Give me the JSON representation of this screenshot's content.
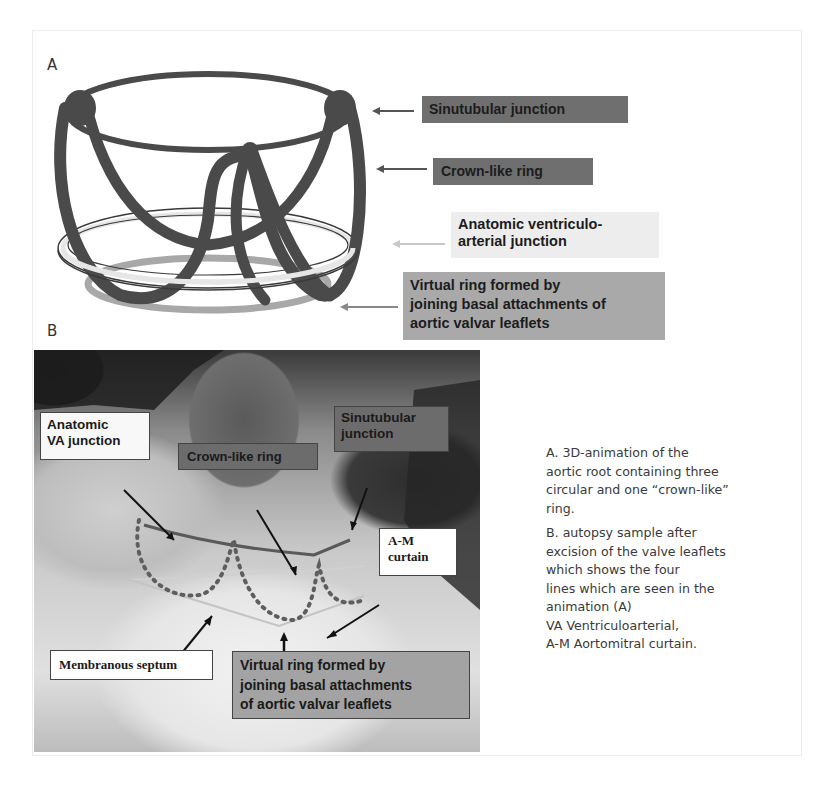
{
  "panel_a": {
    "letter": "A",
    "labels": {
      "sinutubular": "Sinutubular junction",
      "crown": "Crown-like ring",
      "anatomic_line1": "Anatomic ventriculo-",
      "anatomic_line2": "arterial junction",
      "virtual_line1": "Virtual ring formed by",
      "virtual_line2": "joining basal attachments of",
      "virtual_line3": "aortic valvar leaflets"
    },
    "colors": {
      "dark_label": "#6f6f6f",
      "mid_label": "#a9a9a9",
      "light_label": "#ededed",
      "ring_stroke": "#4a4a4a"
    }
  },
  "panel_b": {
    "letter": "B",
    "labels": {
      "anatomic_line1": "Anatomic",
      "anatomic_line2": "VA junction",
      "crown": "Crown-like ring",
      "sinutubular_line1": "Sinutubular",
      "sinutubular_line2": "junction",
      "am_line1": "A-M",
      "am_line2": "curtain",
      "membranous": "Membranous septum",
      "virtual_line1": "Virtual ring formed by",
      "virtual_line2": "joining basal attachments",
      "virtual_line3": "of aortic valvar leaflets"
    }
  },
  "caption": {
    "a_lines": [
      "A. 3D-animation of the",
      "aortic root containing three",
      "circular and one “crown-like”",
      "ring."
    ],
    "b_lines": [
      "B. autopsy sample after",
      "excision of the valve leaflets",
      "which shows the four",
      "lines which are seen in the",
      "animation (A)",
      "VA Ventriculoarterial,",
      "A-M Aortomitral curtain."
    ]
  }
}
